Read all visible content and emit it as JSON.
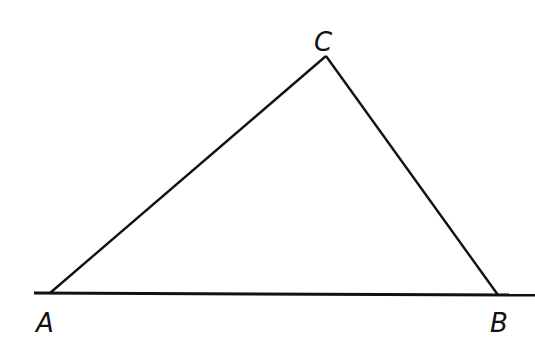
{
  "diagram": {
    "type": "triangle",
    "stroke_color": "#111111",
    "background": "#ffffff",
    "baseline": {
      "x1": 34,
      "y1": 293,
      "x2": 535,
      "y2": 295
    },
    "vertices": [
      {
        "name": "A",
        "x": 50,
        "y": 293,
        "label": "A",
        "label_x": 36,
        "label_y": 332
      },
      {
        "name": "B",
        "x": 498,
        "y": 295,
        "label": "B",
        "label_x": 490,
        "label_y": 332
      },
      {
        "name": "C",
        "x": 326,
        "y": 56,
        "label": "C",
        "label_x": 314,
        "label_y": 51
      }
    ],
    "sides": [
      {
        "name": "AC",
        "from": "A",
        "to": "C"
      },
      {
        "name": "CB",
        "from": "C",
        "to": "B"
      }
    ]
  }
}
